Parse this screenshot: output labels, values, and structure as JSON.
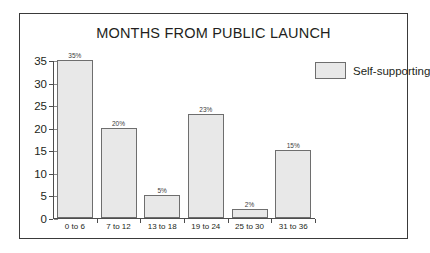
{
  "chart_data": {
    "type": "bar",
    "title": "MONTHS FROM PUBLIC LAUNCH",
    "xlabel": "",
    "ylabel": "",
    "categories": [
      "0 to 6",
      "7 to 12",
      "13 to 18",
      "19 to 24",
      "25 to 30",
      "31 to 36"
    ],
    "values": [
      35,
      20,
      5,
      23,
      2,
      15
    ],
    "data_labels": [
      "35%",
      "20%",
      "5%",
      "23%",
      "2%",
      "15%"
    ],
    "series": [
      {
        "name": "Self-supporting",
        "values": [
          35,
          20,
          5,
          23,
          2,
          15
        ]
      }
    ],
    "ylim": [
      0,
      35
    ],
    "ytick_values": [
      0,
      5,
      10,
      15,
      20,
      25,
      30,
      35
    ],
    "ytick_labels": [
      "0",
      "5",
      "10",
      "15",
      "20",
      "25",
      "30",
      "35"
    ],
    "grid": false,
    "legend": {
      "position": "top-right",
      "entries": [
        {
          "label": "Self-supporting",
          "color": "#e8e8e8"
        }
      ]
    },
    "colors": {
      "bar_fill": "#e8e8e8",
      "bar_border": "#6e6e6e",
      "axis": "#4d4d4d",
      "text": "#231f20",
      "frame": "#3a3a3a",
      "background": "#ffffff"
    }
  }
}
